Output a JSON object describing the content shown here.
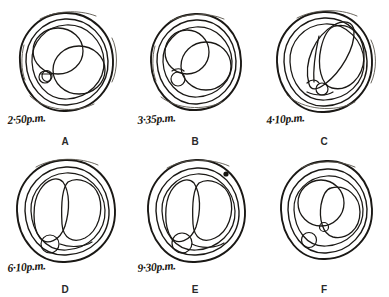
{
  "figure": {
    "type": "scientific-illustration",
    "panel_count": 6,
    "rows": 2,
    "columns": 3,
    "ink_color": "#1a1815",
    "background_color": "#ffffff"
  },
  "panels": [
    {
      "letter": "A",
      "time": "2·50p.m.",
      "row": 0,
      "column": 0,
      "stage": "uncleaved egg, two large internal spheres overlapping, small polar body at lower left"
    },
    {
      "letter": "B",
      "time": "3·35p.m.",
      "row": 0,
      "column": 1,
      "stage": "two overlapping spheres, round polar body at lower left"
    },
    {
      "letter": "C",
      "time": "4·10p.m.",
      "row": 0,
      "column": 2,
      "stage": "elongated cleavage furrow forming, polar body at lower left"
    },
    {
      "letter": "D",
      "time": "6·10p.m.",
      "row": 1,
      "column": 0,
      "stage": "two-cell stage, two blastomeres, polar body at lower left"
    },
    {
      "letter": "E",
      "time": "9·30p.m.",
      "row": 1,
      "column": 1,
      "stage": "two-cell stage with dark granule mark at upper right, polar body at lower left"
    },
    {
      "letter": "F",
      "time": "",
      "row": 1,
      "column": 2,
      "stage": "two blastomeres with small body between them, polar body at lower left"
    }
  ]
}
